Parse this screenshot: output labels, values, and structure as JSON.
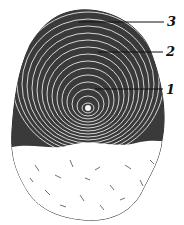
{
  "figure": {
    "labels": [
      {
        "text": "3",
        "x": 167,
        "y": 15,
        "line_from": [
          78,
          22
        ],
        "line_to": [
          164,
          22
        ]
      },
      {
        "text": "2",
        "x": 166,
        "y": 45,
        "line_from": [
          98,
          52
        ],
        "line_to": [
          163,
          52
        ]
      },
      {
        "text": "1",
        "x": 166,
        "y": 83,
        "line_from": [
          95,
          89
        ],
        "line_to": [
          163,
          89
        ]
      }
    ],
    "colors": {
      "ink": "#111111",
      "paper": "#ffffff"
    }
  }
}
